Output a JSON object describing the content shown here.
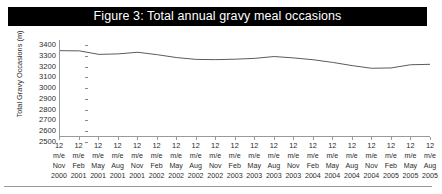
{
  "figure": {
    "title": "Figure 3: Total annual gravy meal occasions",
    "title_bar_color": "#000000",
    "title_text_color": "#ffffff"
  },
  "chart_data": {
    "type": "line",
    "title": "Figure 3: Total annual gravy meal occasions",
    "xlabel": "",
    "ylabel": "Total Gravy Occasions (m)",
    "ylim": [
      2500,
      3400
    ],
    "ytick_step": 100,
    "yticks": [
      3400,
      3300,
      3200,
      3100,
      3000,
      2900,
      2800,
      2700,
      2600,
      2500
    ],
    "grid": false,
    "legend": "none",
    "line_color": "#5a5a5a",
    "categories": [
      "12 m/e Nov 2000",
      "12 m/e Feb 2001",
      "12 m/e May 2001",
      "12 m/e Aug 2001",
      "12 m/e Nov 2001",
      "12 m/e Feb 2002",
      "12 m/e May 2002",
      "12 m/e Aug 2002",
      "12 m/e Nov 2002",
      "12 m/e Feb 2003",
      "12 m/e May 2003",
      "12 m/e Aug 2003",
      "12 m/e Nov 2003",
      "12 m/e Feb 2004",
      "12 m/e May 2004",
      "12 m/e Aug 2004",
      "12 m/e Nov 2004",
      "12 m/e Feb 2005",
      "12 m/e May 2005",
      "12 m/e Aug 2005"
    ],
    "xtick_labels": [
      {
        "l1": "12",
        "l2": "m/e",
        "l3": "Nov",
        "l4": "2000"
      },
      {
        "l1": "12",
        "l2": "m/e",
        "l3": "Feb",
        "l4": "2001"
      },
      {
        "l1": "12",
        "l2": "m/e",
        "l3": "May",
        "l4": "2001"
      },
      {
        "l1": "12",
        "l2": "m/e",
        "l3": "Aug",
        "l4": "2001"
      },
      {
        "l1": "12",
        "l2": "m/e",
        "l3": "Nov",
        "l4": "2001"
      },
      {
        "l1": "12",
        "l2": "m/e",
        "l3": "Feb",
        "l4": "2002"
      },
      {
        "l1": "12",
        "l2": "m/e",
        "l3": "May",
        "l4": "2002"
      },
      {
        "l1": "12",
        "l2": "m/e",
        "l3": "Aug",
        "l4": "2002"
      },
      {
        "l1": "12",
        "l2": "m/e",
        "l3": "Nov",
        "l4": "2002"
      },
      {
        "l1": "12",
        "l2": "m/e",
        "l3": "Feb",
        "l4": "2003"
      },
      {
        "l1": "12",
        "l2": "m/e",
        "l3": "May",
        "l4": "2003"
      },
      {
        "l1": "12",
        "l2": "m/e",
        "l3": "Aug",
        "l4": "2003"
      },
      {
        "l1": "12",
        "l2": "m/e",
        "l3": "Nov",
        "l4": "2003"
      },
      {
        "l1": "12",
        "l2": "m/e",
        "l3": "Feb",
        "l4": "2004"
      },
      {
        "l1": "12",
        "l2": "m/e",
        "l3": "May",
        "l4": "2004"
      },
      {
        "l1": "12",
        "l2": "m/e",
        "l3": "Aug",
        "l4": "2004"
      },
      {
        "l1": "12",
        "l2": "m/e",
        "l3": "Nov",
        "l4": "2004"
      },
      {
        "l1": "12",
        "l2": "m/e",
        "l3": "Feb",
        "l4": "2005"
      },
      {
        "l1": "12",
        "l2": "m/e",
        "l3": "May",
        "l4": "2005"
      },
      {
        "l1": "12",
        "l2": "m/e",
        "l3": "Aug",
        "l4": "2005"
      }
    ],
    "values": [
      3300,
      3298,
      3265,
      3270,
      3285,
      3262,
      3235,
      3218,
      3216,
      3220,
      3228,
      3245,
      3232,
      3215,
      3190,
      3160,
      3135,
      3138,
      3168,
      3172
    ]
  }
}
